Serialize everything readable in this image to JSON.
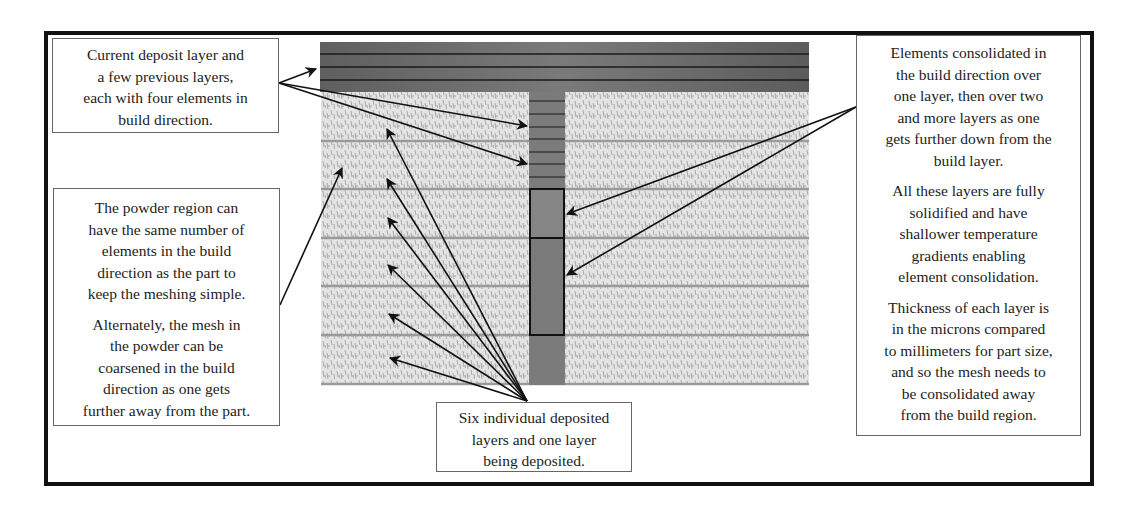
{
  "figure": {
    "type": "FE mesh schematic for additive manufacturing build",
    "regions": {
      "deposit_layers_bar": {
        "color": "#6e6e6e",
        "layer_lines": 4
      },
      "powder_left": {
        "color": "#d9d9d9",
        "layer_lines": 6
      },
      "powder_right": {
        "color": "#d9d9d9",
        "layer_lines": 6
      },
      "part_column": {
        "color": "#777777",
        "fine_elements": 7,
        "consolidated_blocks": 2
      }
    }
  },
  "callouts": {
    "top_left": {
      "lines": [
        "Current deposit layer and",
        "a few previous layers,",
        "each with four elements in",
        "build direction."
      ]
    },
    "left": {
      "paragraphs": [
        [
          "The powder region can",
          "have the same number of",
          "elements in the build",
          "direction as the part to",
          "keep the meshing simple."
        ],
        [
          "Alternately, the mesh in",
          "the powder can be",
          "coarsened in the build",
          "direction as one gets",
          "further away from the part."
        ]
      ]
    },
    "bottom": {
      "lines": [
        "Six individual deposited",
        "layers and one layer",
        "being deposited."
      ]
    },
    "right": {
      "paragraphs": [
        [
          "Elements consolidated in",
          "the build direction over",
          "one layer, then over two",
          "and more layers as one",
          "gets further down from the",
          "build layer."
        ],
        [
          "All these layers are fully",
          "solidified and have",
          "shallower temperature",
          "gradients enabling",
          "element consolidation."
        ],
        [
          "Thickness of each layer is",
          "in the microns compared",
          "to millimeters for part size,",
          "and so the mesh needs to",
          "be consolidated away",
          "from the build region."
        ]
      ]
    }
  }
}
